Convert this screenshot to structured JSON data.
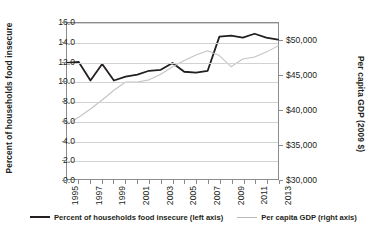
{
  "chart_data": {
    "type": "line",
    "title": "",
    "xlabel": "",
    "ylabel": "Percent of households food insecure",
    "y2label": "Per capita GDP (2009 $)",
    "grid": true,
    "legend_position": "bottom",
    "x": [
      1995,
      1996,
      1997,
      1998,
      1999,
      2000,
      2001,
      2002,
      2003,
      2004,
      2005,
      2006,
      2007,
      2008,
      2009,
      2010,
      2011,
      2012,
      2013
    ],
    "xlim": [
      1995,
      2013
    ],
    "xticklabels": [
      "1995",
      "1997",
      "1999",
      "2001",
      "2003",
      "2005",
      "2007",
      "2009",
      "2011",
      "2013"
    ],
    "xtickvalues": [
      1995,
      1997,
      1999,
      2001,
      2003,
      2005,
      2007,
      2009,
      2011,
      2013
    ],
    "ylim": [
      0.0,
      16.0
    ],
    "yticklabels": [
      "0.0",
      "2.0",
      "4.0",
      "6.0",
      "8.0",
      "10.0",
      "12.0",
      "14.0",
      "16.0"
    ],
    "ytickvalues": [
      0.0,
      2.0,
      4.0,
      6.0,
      8.0,
      10.0,
      12.0,
      14.0,
      16.0
    ],
    "y2lim": [
      30000,
      52500
    ],
    "y2ticklabels": [
      "$30,000",
      "$35,000",
      "$40,000",
      "$45,000",
      "$50,000"
    ],
    "y2tickvalues": [
      30000,
      35000,
      40000,
      45000,
      50000
    ],
    "series": [
      {
        "name": "Percent of households food insecure (left axis)",
        "axis": "left",
        "color": "#231f20",
        "width": 1.8,
        "values": [
          11.9,
          12.0,
          10.1,
          11.8,
          10.1,
          10.5,
          10.7,
          11.1,
          11.2,
          11.9,
          11.0,
          10.9,
          11.1,
          14.6,
          14.7,
          14.5,
          14.9,
          14.5,
          14.3
        ]
      },
      {
        "name": "Per capita GDP (right axis)",
        "axis": "right",
        "color": "#c4c4c4",
        "width": 1.1,
        "values": [
          37900,
          38900,
          40100,
          41400,
          42800,
          44000,
          44000,
          44300,
          45100,
          46200,
          47100,
          47900,
          48500,
          47800,
          46200,
          47300,
          47600,
          48300,
          49200
        ]
      }
    ],
    "legend": [
      {
        "label": "Percent of households food insecure (left axis)",
        "style": "dark"
      },
      {
        "label": "Per capita GDP (right axis)",
        "style": "light"
      }
    ]
  }
}
